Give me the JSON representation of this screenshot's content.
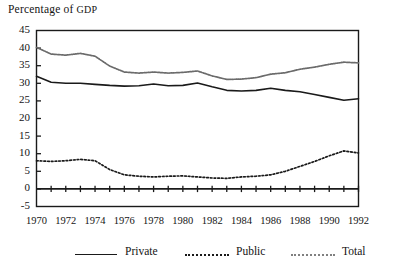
{
  "chart_data": {
    "type": "line",
    "title": "Percentage of GDP",
    "title_main": "Percentage of ",
    "title_smallcaps": "GDP",
    "xlabel": "",
    "ylabel": "",
    "grid": false,
    "legend_position": "below",
    "xlim": [
      1970,
      1992
    ],
    "ylim": [
      -5,
      45
    ],
    "ytick_step": 5,
    "yticks": [
      45,
      40,
      35,
      30,
      25,
      20,
      15,
      10,
      5,
      0,
      -5
    ],
    "ytick_labels": [
      "45",
      "40",
      "35",
      "30",
      "25",
      "20",
      "15",
      "10",
      "5",
      "0",
      "-5"
    ],
    "xticks": [
      1970,
      1971,
      1972,
      1973,
      1974,
      1975,
      1976,
      1977,
      1978,
      1979,
      1980,
      1981,
      1982,
      1983,
      1984,
      1985,
      1986,
      1987,
      1988,
      1989,
      1990,
      1991,
      1992
    ],
    "xtick_labels_shown": [
      "1970",
      "1972",
      "1974",
      "1976",
      "1978",
      "1980",
      "1982",
      "1984",
      "1986",
      "1988",
      "1990",
      "1992"
    ],
    "x": [
      1970,
      1971,
      1972,
      1973,
      1974,
      1975,
      1976,
      1977,
      1978,
      1979,
      1980,
      1981,
      1982,
      1983,
      1984,
      1985,
      1986,
      1987,
      1988,
      1989,
      1990,
      1991,
      1992
    ],
    "series": [
      {
        "name": "Private",
        "style": "solid",
        "color": "#1a1a1a",
        "values": [
          32.0,
          30.3,
          30.0,
          30.0,
          29.7,
          29.4,
          29.2,
          29.3,
          29.8,
          29.3,
          29.4,
          30.1,
          29.0,
          28.0,
          27.8,
          28.0,
          28.6,
          28.0,
          27.6,
          26.8,
          26.0,
          25.2,
          25.6
        ]
      },
      {
        "name": "Public",
        "style": "dotted",
        "color": "#1a1a1a",
        "values": [
          8.0,
          7.8,
          8.0,
          8.4,
          8.0,
          5.5,
          4.0,
          3.6,
          3.4,
          3.6,
          3.7,
          3.4,
          3.1,
          3.0,
          3.4,
          3.6,
          4.0,
          5.0,
          6.4,
          7.8,
          9.4,
          10.8,
          10.2
        ]
      },
      {
        "name": "Total",
        "style": "fine-dotted",
        "color": "#6b6b6b",
        "values": [
          40.2,
          38.3,
          38.0,
          38.5,
          37.7,
          34.9,
          33.2,
          32.9,
          33.2,
          32.9,
          33.1,
          33.5,
          32.1,
          31.1,
          31.2,
          31.6,
          32.6,
          33.0,
          34.0,
          34.6,
          35.4,
          36.0,
          35.8
        ]
      }
    ]
  },
  "legend": {
    "items": [
      {
        "label": "Private",
        "style": "solid",
        "color": "#1a1a1a"
      },
      {
        "label": "Public",
        "style": "dotted",
        "color": "#1a1a1a"
      },
      {
        "label": "Total",
        "style": "fine-dotted",
        "color": "#6b6b6b"
      }
    ]
  }
}
